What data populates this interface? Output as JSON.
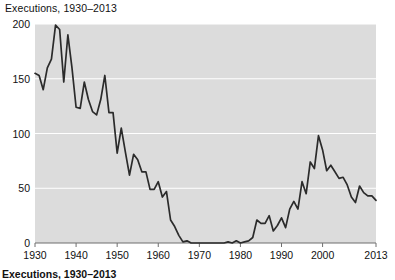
{
  "chart_data": {
    "type": "line",
    "title": "Executions, 1930–2013",
    "caption": "Executions, 1930–2013",
    "xlabel": "",
    "ylabel": "",
    "xlim": [
      1930,
      2013
    ],
    "ylim": [
      0,
      200
    ],
    "grid": true,
    "legend": "none",
    "yticks": [
      "0",
      "50",
      "100",
      "150",
      "200"
    ],
    "ytick_values": [
      0,
      50,
      100,
      150,
      200
    ],
    "xticks": [
      "1930",
      "1940",
      "1950",
      "1960",
      "1970",
      "1980",
      "1990",
      "2000",
      "2013"
    ],
    "xtick_values": [
      1930,
      1940,
      1950,
      1960,
      1970,
      1980,
      1990,
      2000,
      2013
    ],
    "series": [
      {
        "name": "Executions",
        "color": "#2b2b2b",
        "x": [
          1930,
          1931,
          1932,
          1933,
          1934,
          1935,
          1936,
          1937,
          1938,
          1939,
          1940,
          1941,
          1942,
          1943,
          1944,
          1945,
          1946,
          1947,
          1948,
          1949,
          1950,
          1951,
          1952,
          1953,
          1954,
          1955,
          1956,
          1957,
          1958,
          1959,
          1960,
          1961,
          1962,
          1963,
          1964,
          1965,
          1966,
          1967,
          1968,
          1969,
          1970,
          1971,
          1972,
          1973,
          1974,
          1975,
          1976,
          1977,
          1978,
          1979,
          1980,
          1981,
          1982,
          1983,
          1984,
          1985,
          1986,
          1987,
          1988,
          1989,
          1990,
          1991,
          1992,
          1993,
          1994,
          1995,
          1996,
          1997,
          1998,
          1999,
          2000,
          2001,
          2002,
          2003,
          2004,
          2005,
          2006,
          2007,
          2008,
          2009,
          2010,
          2011,
          2012,
          2013
        ],
        "values": [
          155,
          153,
          140,
          160,
          168,
          199,
          195,
          147,
          190,
          160,
          124,
          123,
          147,
          131,
          120,
          117,
          131,
          153,
          119,
          119,
          82,
          105,
          83,
          62,
          81,
          76,
          65,
          65,
          49,
          49,
          56,
          42,
          47,
          21,
          15,
          7,
          1,
          2,
          0,
          0,
          0,
          0,
          0,
          0,
          0,
          0,
          0,
          1,
          0,
          2,
          0,
          1,
          2,
          5,
          21,
          18,
          18,
          25,
          11,
          16,
          23,
          14,
          31,
          38,
          31,
          56,
          45,
          74,
          68,
          98,
          85,
          66,
          71,
          65,
          59,
          60,
          53,
          42,
          37,
          52,
          46,
          43,
          43,
          39
        ]
      }
    ]
  }
}
